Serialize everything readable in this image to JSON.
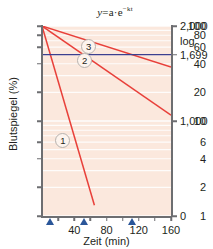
{
  "chart_data": {
    "type": "line",
    "title_parts": {
      "lhs": "y",
      "eq": "=",
      "a": "a",
      "dot": "·",
      "e": "e",
      "exp": "−kt"
    },
    "xlabel": "Zeit (min)",
    "ylabel": "Blutspiegel (%)",
    "right_axis_label": "log",
    "xlim": [
      0,
      160
    ],
    "ylim": [
      1,
      100
    ],
    "yscale": "log",
    "grid": true,
    "grid_orientation": "horizontal",
    "xticks": [
      40,
      80,
      120,
      160
    ],
    "xtick_labels": [
      "40",
      "80",
      "120",
      "160"
    ],
    "xminor_ticks": [
      20,
      60,
      100,
      140
    ],
    "yticks": [
      100,
      80,
      60,
      40,
      20,
      10,
      6,
      4,
      2,
      1
    ],
    "ytick_labels": [
      "100",
      "80",
      "60",
      "40",
      "20",
      "10",
      "6",
      "4",
      "2",
      "1"
    ],
    "right_ticks": [
      {
        "value": 100,
        "label": "2,000"
      },
      {
        "value": 50,
        "label": "1,699"
      },
      {
        "value": 10,
        "label": "1,000"
      },
      {
        "value": 1,
        "label": "0"
      }
    ],
    "series": [
      {
        "name": "1",
        "label": "1",
        "color": "#e8403a",
        "x": [
          0,
          65
        ],
        "y": [
          100,
          1.3
        ],
        "half_life_min": 10,
        "badge_at": {
          "x": 26,
          "y": 6.2
        }
      },
      {
        "name": "2",
        "label": "2",
        "color": "#e8403a",
        "x": [
          0,
          160
        ],
        "y": [
          100,
          11.5
        ],
        "half_life_min": 52,
        "badge_at": {
          "x": 53,
          "y": 43
        }
      },
      {
        "name": "3",
        "label": "3",
        "color": "#e8403a",
        "x": [
          0,
          160
        ],
        "y": [
          100,
          37
        ],
        "half_life_min": 112,
        "badge_at": {
          "x": 58,
          "y": 61
        }
      }
    ],
    "reference_line": {
      "name": "half-maximal-level",
      "orientation": "horizontal",
      "value": 50,
      "color": "#3b3f8f",
      "right_label": "1,699"
    },
    "markers": [
      {
        "name": "half-life-1",
        "x": 10,
        "color": "#2a5699"
      },
      {
        "name": "half-life-2",
        "x": 52,
        "color": "#2a5699"
      },
      {
        "name": "half-life-3",
        "x": 112,
        "color": "#2a5699"
      }
    ],
    "colors": {
      "plot_background": "#fbe8dd",
      "gridline": "#ffffff",
      "axis": "#6d6e71",
      "curve": "#e8403a",
      "reference": "#3b3f8f",
      "marker": "#2a5699",
      "text": "#231f20"
    }
  }
}
